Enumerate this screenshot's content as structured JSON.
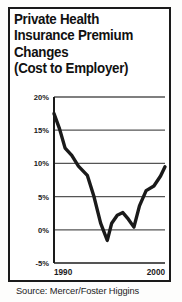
{
  "title": {
    "lines": [
      "Private Health",
      "Insurance Premium",
      "Changes",
      "(Cost to Employer)"
    ]
  },
  "source": {
    "text": "Source: Mercer/Foster Higgins"
  },
  "colors": {
    "line": "#1a1a1a",
    "grid": "#555555",
    "axis": "#1a1a1a",
    "frame": "#1a1a1a",
    "background": "#ffffff",
    "text": "#111111"
  },
  "chart_data": {
    "type": "line",
    "title": "Private Health Insurance Premium Changes (Cost to Employer)",
    "subtitle": "(Cost to Employer)",
    "xlabel": "",
    "ylabel": "",
    "ylim": [
      -5,
      20
    ],
    "xlim": [
      1990,
      2000
    ],
    "yticks": [
      20,
      15,
      10,
      5,
      0,
      -5
    ],
    "ytick_labels": [
      "20%",
      "15%",
      "10%",
      "5%",
      "0%",
      "-5%"
    ],
    "xticks": [
      1990,
      2000
    ],
    "xtick_labels": [
      "1990",
      "2000"
    ],
    "grid": true,
    "legend": "none",
    "series": [
      {
        "name": "Premium change",
        "x": [
          1990,
          1990.5,
          1991,
          1991.6,
          1992.2,
          1993,
          1993.6,
          1994.2,
          1994.8,
          1995.2,
          1995.7,
          1996.2,
          1996.7,
          1997.2,
          1997.7,
          1998.3,
          1999,
          1999.6,
          2000
        ],
        "values": [
          17.5,
          15.2,
          12.3,
          11.2,
          9.6,
          8.2,
          5.0,
          1.0,
          -1.6,
          1.0,
          2.2,
          2.6,
          1.6,
          0.4,
          3.6,
          5.9,
          6.6,
          8.1,
          9.5
        ]
      }
    ],
    "annotations": [],
    "source": "Source: Mercer/Foster Higgins"
  }
}
